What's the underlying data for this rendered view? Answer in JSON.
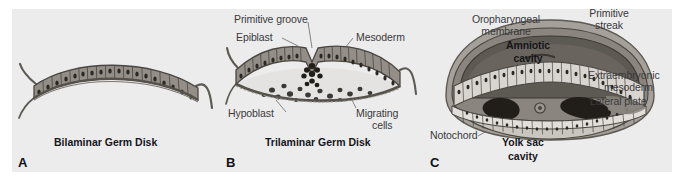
{
  "figure": {
    "background_color": "#ececed",
    "page_color": "#ffffff"
  },
  "palette": {
    "epithelium_fill": "#8f8a84",
    "epithelium_dark": "#6d6862",
    "nucleus": "#2b2823",
    "outline": "#4a4641",
    "amnion_fill": "#7d7871",
    "amnion_inner": "#5d5953",
    "yolk_fill": "#9b968f",
    "mesoderm_dark": "#26231f",
    "label_text": "#3a3a3c",
    "caption_text": "#16161a"
  },
  "panels": [
    {
      "letter": "A",
      "caption": "Bilaminar Germ Disk",
      "labels": []
    },
    {
      "letter": "B",
      "caption": "Trilaminar Germ Disk",
      "labels": [
        {
          "name": "primitive-groove",
          "text": "Primitive groove"
        },
        {
          "name": "epiblast",
          "text": "Epiblast"
        },
        {
          "name": "mesoderm",
          "text": "Mesoderm"
        },
        {
          "name": "hypoblast",
          "text": "Hypoblast"
        },
        {
          "name": "migrating-cells",
          "text": "Migrating cells"
        }
      ]
    },
    {
      "letter": "C",
      "caption": "Yolk sac cavity",
      "labels": [
        {
          "name": "oropharyngeal-membrane",
          "text": "Oropharyngeal membrane"
        },
        {
          "name": "primitive-streak",
          "text": "Primitive streak"
        },
        {
          "name": "amniotic-cavity",
          "text": "Amniotic cavity"
        },
        {
          "name": "extraembryonic-mesoderm",
          "text": "Extraembryonic mesoderm"
        },
        {
          "name": "lateral-plate",
          "text": "Lateral plate"
        },
        {
          "name": "notochord",
          "text": "Notochord"
        }
      ]
    }
  ],
  "panel_a": {
    "letter": "A",
    "caption": "Bilaminar Germ Disk"
  },
  "panel_b": {
    "letter": "B",
    "caption": "Trilaminar Germ Disk",
    "primitive_groove": "Primitive groove",
    "epiblast": "Epiblast",
    "mesoderm": "Mesoderm",
    "hypoblast": "Hypoblast",
    "migrating_cells_line1": "Migrating",
    "migrating_cells_line2": "cells"
  },
  "panel_c": {
    "letter": "C",
    "caption_line1": "Yolk sac",
    "caption_line2": "cavity",
    "oropharyngeal_line1": "Oropharyngeal",
    "oropharyngeal_line2": "membrane",
    "primitive_streak_line1": "Primitive",
    "primitive_streak_line2": "streak",
    "amniotic_line1": "Amniotic",
    "amniotic_line2": "cavity",
    "extraembryonic_line1": "Extraembryonic",
    "extraembryonic_line2": "mesoderm",
    "lateral_plate": "Lateral plate",
    "notochord": "Notochord"
  }
}
